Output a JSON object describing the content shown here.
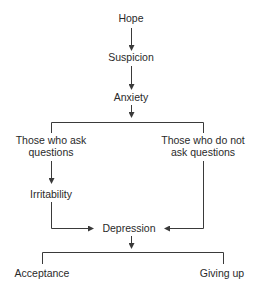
{
  "diagram": {
    "line_color": "#3a3a3a",
    "text_color": "#2a2a2a",
    "nodes": {
      "hope": "Hope",
      "suspicion": "Suspicion",
      "anxiety": "Anxiety",
      "ask_line1": "Those who ask",
      "ask_line2": "questions",
      "not_ask_line1": "Those who do not",
      "not_ask_line2": "ask questions",
      "irritability": "Irritability",
      "depression": "Depression",
      "acceptance": "Acceptance",
      "giving_up": "Giving up"
    },
    "edges": [
      {
        "from": "Hope",
        "to": "Suspicion"
      },
      {
        "from": "Suspicion",
        "to": "Anxiety"
      },
      {
        "from": "Anxiety",
        "to": [
          "Those who ask questions",
          "Those who do not ask questions"
        ]
      },
      {
        "from": "Those who ask questions",
        "to": "Irritability"
      },
      {
        "from": "Irritability",
        "to": "Depression"
      },
      {
        "from": "Those who do not ask questions",
        "to": "Depression"
      },
      {
        "from": "Depression",
        "to": [
          "Acceptance",
          "Giving up"
        ]
      }
    ]
  }
}
